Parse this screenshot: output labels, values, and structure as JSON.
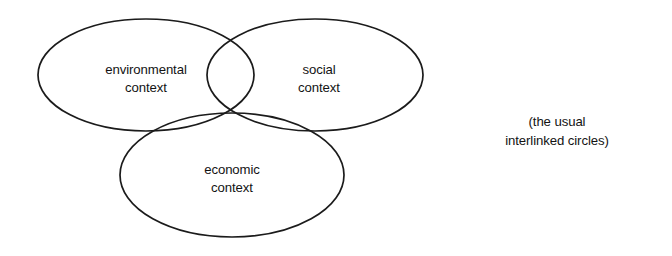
{
  "figure": {
    "type": "venn-diagram-3-set",
    "background_color": "#ffffff",
    "stroke_color": "#1b1b1b",
    "text_color": "#131313",
    "sets": [
      {
        "id": "environmental",
        "label_line_1": "environmental",
        "label_line_2": "context",
        "position": "left"
      },
      {
        "id": "social",
        "label_line_1": "social",
        "label_line_2": "context",
        "position": "right"
      },
      {
        "id": "economic",
        "label_line_1": "economic",
        "label_line_2": "context",
        "position": "bottom"
      }
    ],
    "annotation": {
      "line_1": "(the usual",
      "line_2": "interlinked circles)"
    }
  },
  "geometry": {
    "canvas": {
      "width": 672,
      "height": 256
    },
    "ellipses": [
      {
        "id": "environmental",
        "cx": 146,
        "cy": 75,
        "rx": 108,
        "ry": 56
      },
      {
        "id": "social",
        "cx": 315,
        "cy": 75,
        "rx": 108,
        "ry": 56
      },
      {
        "id": "economic",
        "cx": 232,
        "cy": 175,
        "rx": 112,
        "ry": 62
      }
    ]
  }
}
